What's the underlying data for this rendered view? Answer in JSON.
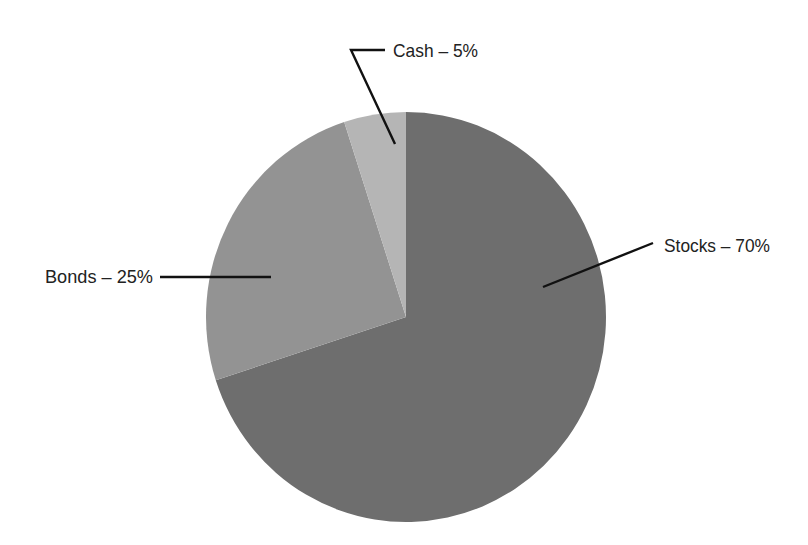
{
  "chart_data": {
    "type": "pie",
    "title": "",
    "categories": [
      "Stocks",
      "Bonds",
      "Cash"
    ],
    "values": [
      70,
      25,
      5
    ],
    "unit": "%",
    "labels": [
      "Stocks – 70%",
      "Bonds – 25%",
      "Cash – 5%"
    ],
    "colors": [
      "#6e6e6e",
      "#939393",
      "#b5b5b5"
    ],
    "start_angle_deg": 0,
    "direction": "clockwise",
    "legend": "none",
    "label_style": "external labels with leader lines"
  },
  "labels": {
    "stocks": "Stocks – 70%",
    "bonds": "Bonds – 25%",
    "cash": "Cash – 5%"
  }
}
